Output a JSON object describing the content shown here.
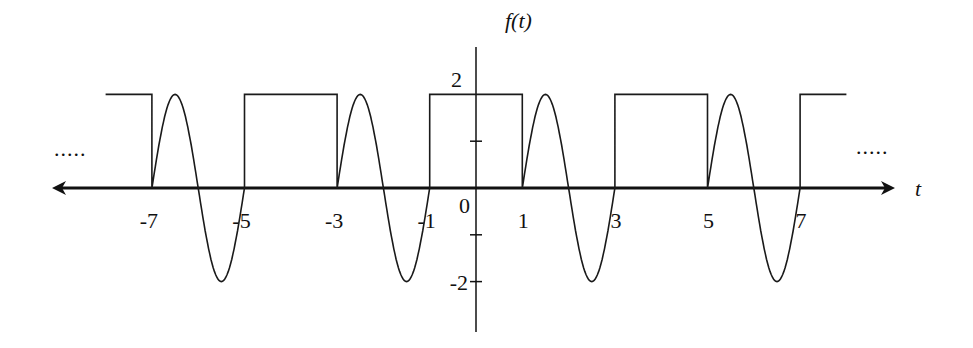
{
  "figure": {
    "y_label": "f(t)",
    "x_label": "t",
    "origin_label": "0",
    "left_ellipsis": ".....",
    "right_ellipsis": ".....",
    "colors": {
      "stroke": "#111111",
      "background": "#ffffff"
    }
  },
  "axes": {
    "x_ticks": [
      {
        "t": -7,
        "label": "-7"
      },
      {
        "t": -5,
        "label": "-5"
      },
      {
        "t": -3,
        "label": "-3"
      },
      {
        "t": -1,
        "label": "-1"
      },
      {
        "t": 1,
        "label": "1"
      },
      {
        "t": 3,
        "label": "3"
      },
      {
        "t": 5,
        "label": "5"
      },
      {
        "t": 7,
        "label": "7"
      }
    ],
    "y_ticks": [
      {
        "v": 2,
        "label": "2"
      },
      {
        "v": 1,
        "label": ""
      },
      {
        "v": -1,
        "label": ""
      },
      {
        "v": -2,
        "label": "-2"
      }
    ]
  },
  "signal": {
    "description": "Periodic signal, period 4: square pulse of height 2 on [-1,1]; one full cycle of 2*sin(pi*(t-1)) on [1,3]; repeated",
    "t_range": [
      -8,
      8
    ],
    "segments": [
      {
        "type": "square",
        "from": -8,
        "to": -7,
        "amplitude": 2
      },
      {
        "type": "sine",
        "from": -7,
        "to": -5,
        "amplitude": 2
      },
      {
        "type": "square",
        "from": -5,
        "to": -3,
        "amplitude": 2
      },
      {
        "type": "sine",
        "from": -3,
        "to": -1,
        "amplitude": 2
      },
      {
        "type": "square",
        "from": -1,
        "to": 1,
        "amplitude": 2
      },
      {
        "type": "sine",
        "from": 1,
        "to": 3,
        "amplitude": 2
      },
      {
        "type": "square",
        "from": 3,
        "to": 5,
        "amplitude": 2
      },
      {
        "type": "sine",
        "from": 5,
        "to": 7,
        "amplitude": 2
      },
      {
        "type": "square",
        "from": 7,
        "to": 8,
        "amplitude": 2
      }
    ]
  },
  "layout": {
    "origin_x": 476,
    "origin_y": 188,
    "px_per_t": 46.3,
    "px_per_v": 46.8
  }
}
